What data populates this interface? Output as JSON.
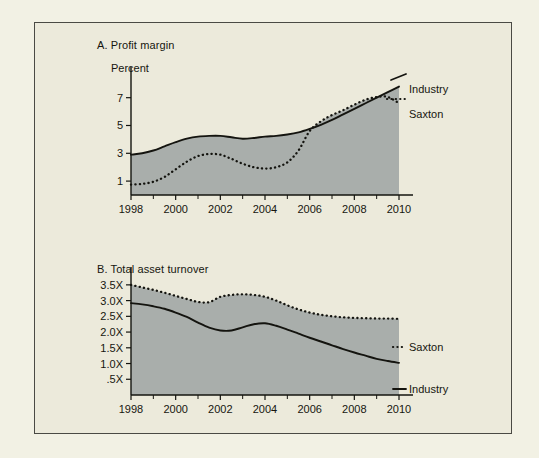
{
  "figure": {
    "background_color": "#eceadb",
    "page_color": "#f2f1e4",
    "frame_color": "#4a4a44",
    "fill_color": "#a9aeab",
    "line_color": "#14140f"
  },
  "chart_data": [
    {
      "type": "line",
      "panel": "A",
      "title": "A. Profit margin",
      "ylabel": "Percent",
      "xlabel": "",
      "ylim": [
        0,
        8.2
      ],
      "xlim": [
        1998,
        2010
      ],
      "yticks": [
        1,
        3,
        5,
        7
      ],
      "ytick_labels": [
        "1",
        "3",
        "5",
        "7"
      ],
      "xticks": [
        1998,
        2000,
        2002,
        2004,
        2006,
        2008,
        2010
      ],
      "xtick_labels": [
        "1998",
        "2000",
        "2002",
        "2004",
        "2006",
        "2008",
        "2010"
      ],
      "grid": false,
      "legend_position": "right-inline",
      "x": [
        1998,
        1998.5,
        1999,
        1999.5,
        2000,
        2000.5,
        2001,
        2001.5,
        2002,
        2002.5,
        2003,
        2003.5,
        2004,
        2004.5,
        2005,
        2005.5,
        2006,
        2006.5,
        2007,
        2007.5,
        2008,
        2008.5,
        2009,
        2009.5,
        2010
      ],
      "series": [
        {
          "name": "Industry",
          "style": "solid",
          "values": [
            2.9,
            3.0,
            3.2,
            3.5,
            3.8,
            4.05,
            4.2,
            4.25,
            4.25,
            4.15,
            4.05,
            4.1,
            4.2,
            4.25,
            4.35,
            4.5,
            4.75,
            5.05,
            5.4,
            5.8,
            6.2,
            6.6,
            7.0,
            7.4,
            7.8
          ]
        },
        {
          "name": "Saxton",
          "style": "dotted",
          "values": [
            0.75,
            0.8,
            0.95,
            1.3,
            1.85,
            2.4,
            2.8,
            2.95,
            2.9,
            2.6,
            2.25,
            2.0,
            1.9,
            2.0,
            2.35,
            3.2,
            4.6,
            5.3,
            5.75,
            6.1,
            6.5,
            6.85,
            7.05,
            7.05,
            6.6
          ]
        }
      ]
    },
    {
      "type": "line",
      "panel": "B",
      "title": "B. Total asset turnover",
      "ylabel": "",
      "xlabel": "",
      "ylim": [
        0,
        3.75
      ],
      "xlim": [
        1998,
        2010
      ],
      "yticks": [
        0.5,
        1.0,
        1.5,
        2.0,
        2.5,
        3.0,
        3.5
      ],
      "ytick_labels": [
        ".5X",
        "1.0X",
        "1.5X",
        "2.0X",
        "2.5X",
        "3.0X",
        "3.5X"
      ],
      "xticks": [
        1998,
        2000,
        2002,
        2004,
        2006,
        2008,
        2010
      ],
      "xtick_labels": [
        "1998",
        "2000",
        "2002",
        "2004",
        "2006",
        "2008",
        "2010"
      ],
      "grid": false,
      "legend_position": "right-inline",
      "x": [
        1998,
        1998.5,
        1999,
        1999.5,
        2000,
        2000.5,
        2001,
        2001.5,
        2002,
        2002.5,
        2003,
        2003.5,
        2004,
        2004.5,
        2005,
        2005.5,
        2006,
        2006.5,
        2007,
        2007.5,
        2008,
        2008.5,
        2009,
        2009.5,
        2010
      ],
      "series": [
        {
          "name": "Saxton",
          "style": "dotted",
          "values": [
            3.5,
            3.42,
            3.34,
            3.25,
            3.15,
            3.05,
            2.96,
            2.95,
            3.12,
            3.18,
            3.2,
            3.18,
            3.12,
            3.0,
            2.85,
            2.72,
            2.62,
            2.55,
            2.5,
            2.47,
            2.45,
            2.44,
            2.43,
            2.43,
            2.42
          ]
        },
        {
          "name": "Industry",
          "style": "solid",
          "values": [
            2.92,
            2.88,
            2.82,
            2.74,
            2.62,
            2.48,
            2.3,
            2.14,
            2.05,
            2.05,
            2.15,
            2.25,
            2.28,
            2.2,
            2.08,
            1.95,
            1.82,
            1.7,
            1.58,
            1.46,
            1.35,
            1.25,
            1.15,
            1.08,
            1.02
          ]
        }
      ]
    }
  ]
}
